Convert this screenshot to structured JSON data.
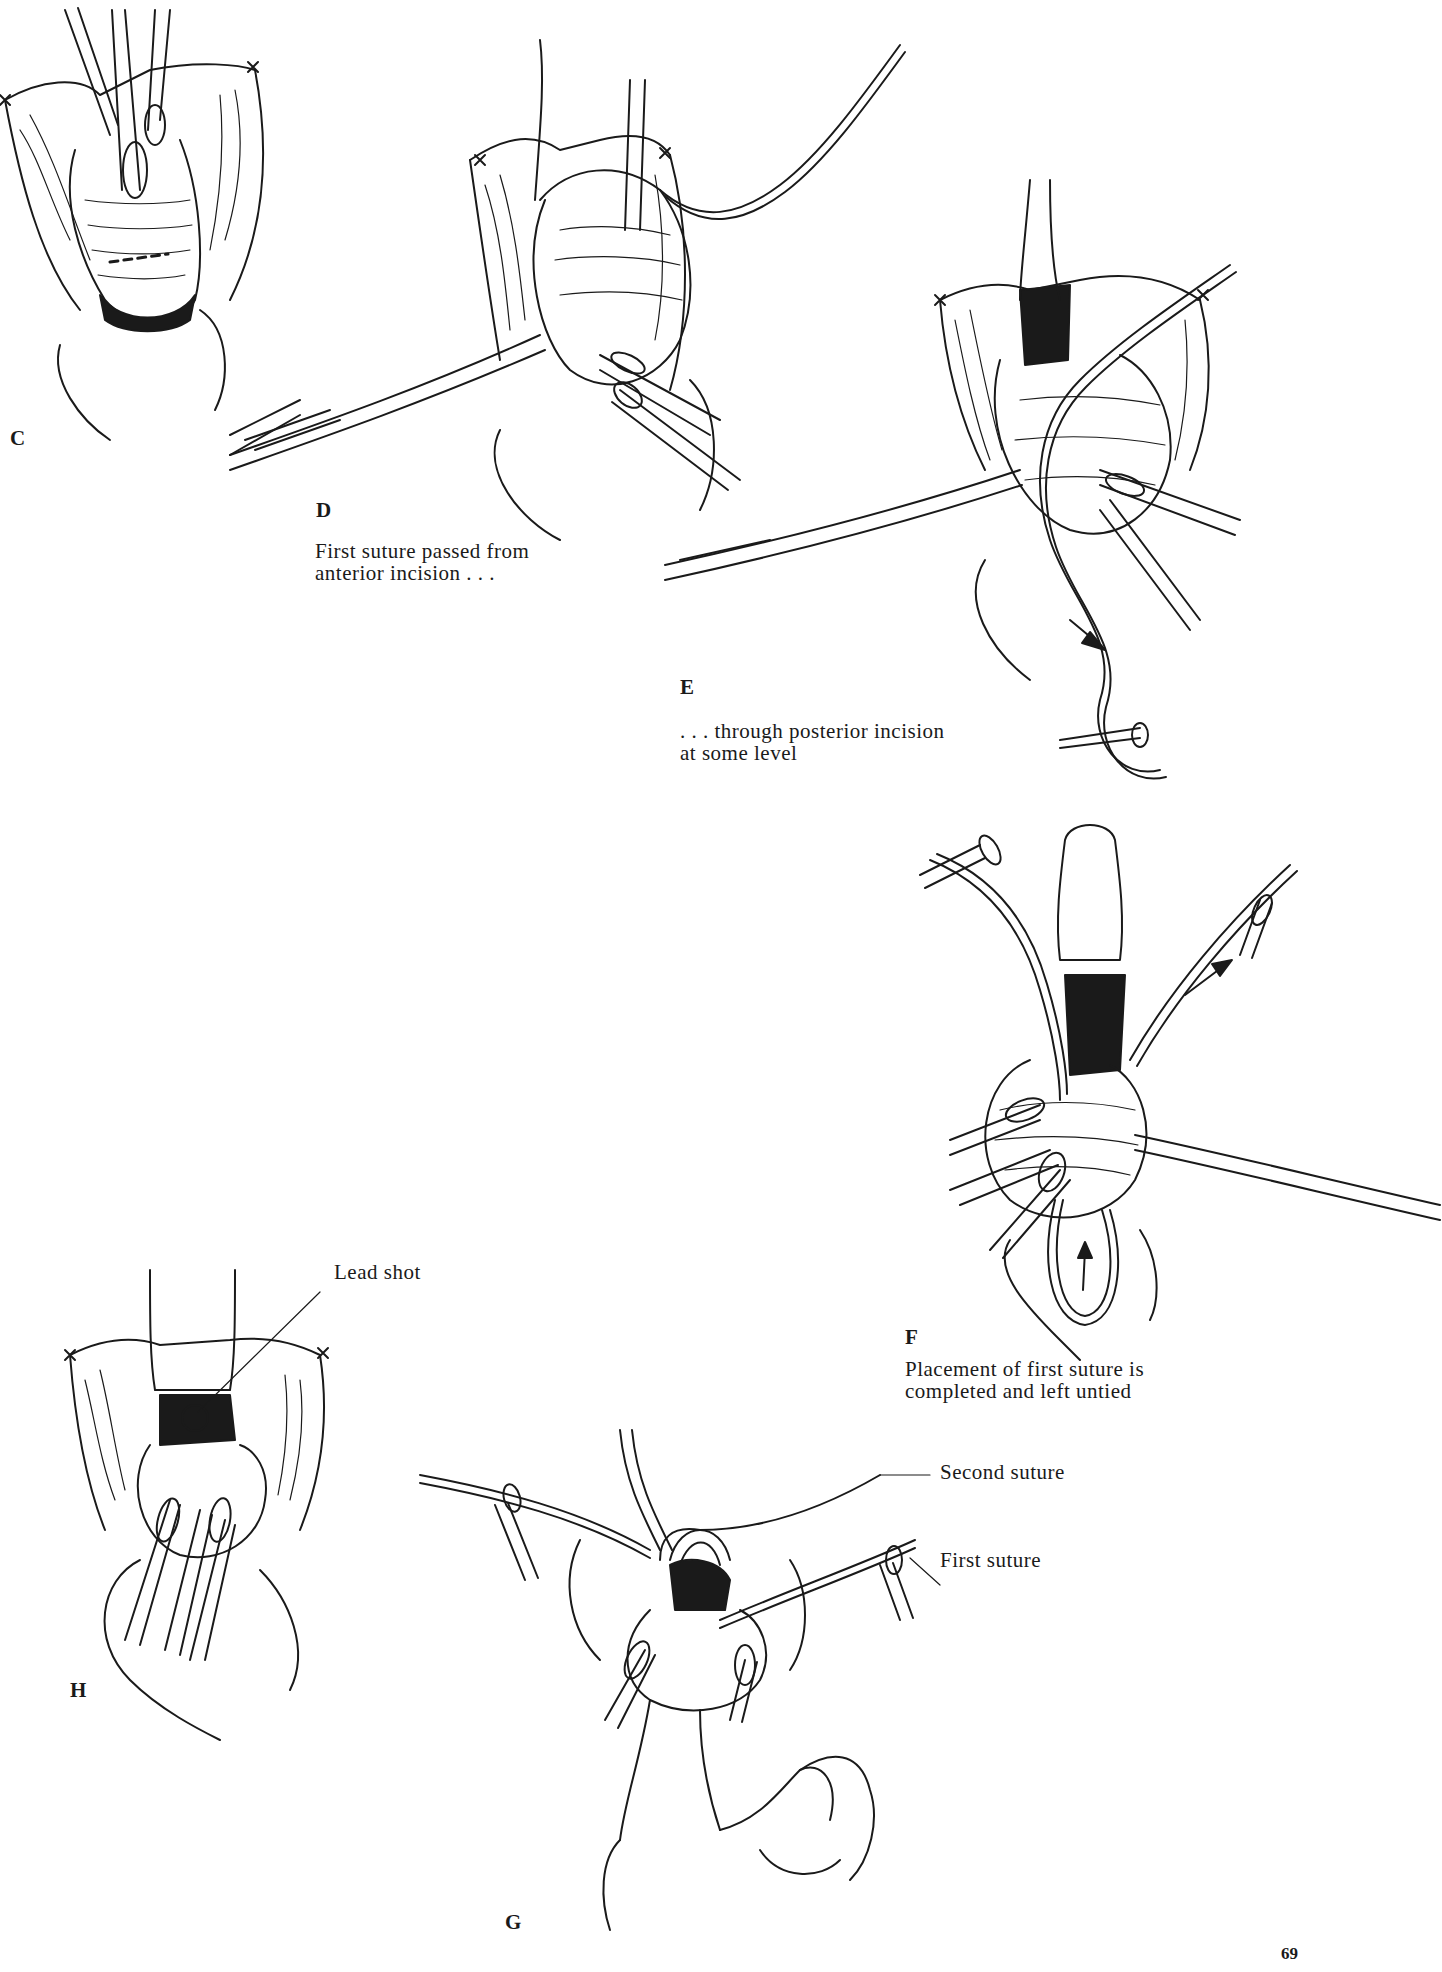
{
  "page": {
    "number": "69"
  },
  "panels": [
    {
      "id": "C",
      "label": "C",
      "caption": ""
    },
    {
      "id": "D",
      "label": "D",
      "caption": "First suture passed from\nanterior incision . . ."
    },
    {
      "id": "E",
      "label": "E",
      "caption": ". . . through posterior incision\nat some level"
    },
    {
      "id": "F",
      "label": "F",
      "caption": "Placement of first suture is\ncompleted and left untied"
    },
    {
      "id": "H",
      "label": "H",
      "caption": ""
    },
    {
      "id": "G",
      "label": "G",
      "caption": ""
    }
  ],
  "callouts": {
    "lead_shot": "Lead shot",
    "second_suture": "Second suture",
    "first_suture": "First suture"
  },
  "illustrations": {
    "style": "black-and-white surgical line drawing",
    "stroke_color": "#1a1a1a",
    "background": "#ffffff"
  }
}
